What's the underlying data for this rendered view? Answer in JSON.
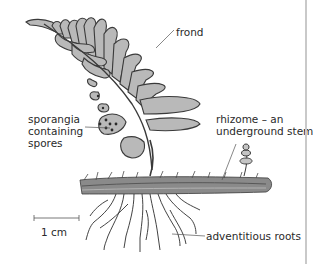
{
  "diagram": {
    "labels": {
      "frond": "frond",
      "sporangia_line1": "sporangia",
      "sporangia_line2": "containing",
      "sporangia_line3": "spores",
      "rhizome_line1": "rhizome – an",
      "rhizome_line2": "underground stem",
      "roots": "adventitious roots",
      "scale": "1 cm"
    },
    "colors": {
      "frond_fill": "#b9b9b9",
      "outline": "#3a3a3a",
      "leader": "#555555",
      "rhizome": "#6e6e6e",
      "background": "#ffffff"
    }
  }
}
